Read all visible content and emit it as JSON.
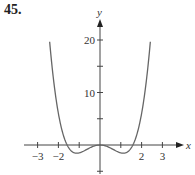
{
  "problem_number": "45.",
  "chart_data": {
    "type": "line",
    "title": "",
    "xlabel": "x",
    "ylabel": "y",
    "xlim": [
      -3.3,
      3.6
    ],
    "ylim": [
      -5,
      23
    ],
    "x_ticks": [
      -3,
      -2,
      -1,
      1,
      2,
      3
    ],
    "x_tick_labels": [
      "−3",
      "−2",
      "2",
      "3"
    ],
    "x_tick_labels_at": [
      -3,
      -2,
      2,
      3
    ],
    "y_ticks": [
      -5,
      5,
      10,
      15,
      20
    ],
    "y_tick_labels": [
      "10",
      "20"
    ],
    "y_tick_labels_at": [
      10,
      20
    ],
    "grid": false,
    "legend": null,
    "series": [
      {
        "name": "curve",
        "color": "#666666",
        "x": [
          -2.42,
          -2.2,
          -2.0,
          -1.8,
          -1.6,
          -1.4,
          -1.2,
          -1.0,
          -0.8,
          -0.6,
          -0.4,
          -0.2,
          0,
          0.2,
          0.4,
          0.6,
          0.8,
          1.0,
          1.2,
          1.4,
          1.6,
          1.8,
          2.0,
          2.2,
          2.42
        ],
        "y": [
          19.7,
          11.3,
          6.0,
          2.4,
          0.2,
          -1.06,
          -1.53,
          -1.5,
          -1.19,
          -0.77,
          -0.37,
          -0.1,
          0,
          -0.1,
          -0.37,
          -0.77,
          -1.19,
          -1.5,
          -1.53,
          -1.06,
          0.2,
          2.4,
          6.0,
          11.3,
          19.7
        ]
      }
    ]
  }
}
